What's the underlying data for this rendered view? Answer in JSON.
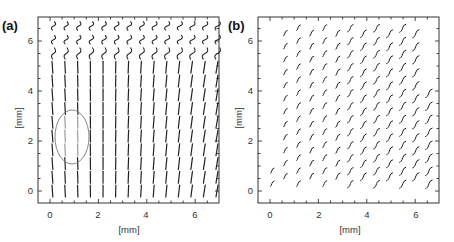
{
  "chart_data": [
    {
      "type": "scatter",
      "subtype": "vector-field",
      "panel_label": "(a)",
      "title": "",
      "xlabel": "[mm]",
      "ylabel": "[mm]",
      "xlim": [
        -0.5,
        7
      ],
      "ylim": [
        -0.5,
        7
      ],
      "xticks": [
        0,
        2,
        4,
        6
      ],
      "yticks": [
        0,
        2,
        4,
        6
      ],
      "grid": false,
      "legend": null,
      "glyph": "near-vertical line segments (wavy in upper rows)",
      "grid_columns": 14,
      "grid_rows": 13,
      "x_range_mm": [
        0.1,
        6.9
      ],
      "y_range_mm": [
        0,
        6.6
      ],
      "annotations": [
        {
          "type": "ellipse",
          "center_mm": [
            0.9,
            2.3
          ],
          "radius_mm": [
            0.7,
            1.1
          ],
          "note": "circled region of lighter/shorter segments"
        }
      ]
    },
    {
      "type": "scatter",
      "subtype": "vector-field",
      "panel_label": "(b)",
      "title": "",
      "xlabel": "[mm]",
      "ylabel": "[mm]",
      "xlim": [
        -0.5,
        7
      ],
      "ylim": [
        -0.5,
        7
      ],
      "xticks": [
        0,
        2,
        4,
        6
      ],
      "yticks": [
        0,
        2,
        4,
        6
      ],
      "grid": false,
      "legend": null,
      "glyph": "small S-shaped hooks, tilted",
      "grid_columns": 13,
      "grid_rows": 13,
      "x_range_mm": [
        0.1,
        6.7
      ],
      "y_range_mm": [
        0.3,
        6.7
      ],
      "note": "grid is skewed: leftmost columns start higher; points fill a lower-left triangle-cut region"
    }
  ],
  "panels": [
    {
      "id": "a",
      "label": "(a)",
      "xlabel": "[mm]",
      "ylabel": "[mm]",
      "xtick_labels": [
        "0",
        "2",
        "4",
        "6"
      ],
      "ytick_labels": [
        "0",
        "2",
        "4",
        "6"
      ]
    },
    {
      "id": "b",
      "label": "(b)",
      "xlabel": "[mm]",
      "ylabel": "[mm]",
      "xtick_labels": [
        "0",
        "2",
        "4",
        "6"
      ],
      "ytick_labels": [
        "0",
        "2",
        "4",
        "6"
      ]
    }
  ],
  "colors": {
    "ink": "#222222",
    "frame": "#333333",
    "ellipse": "#777777",
    "faint": "#9a9a9a"
  }
}
